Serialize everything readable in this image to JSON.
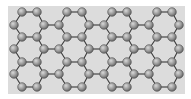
{
  "diagram": {
    "type": "hexagonal-lattice",
    "colors": {
      "page_background": "#ffffff",
      "panel_background": "#dcdcdc",
      "atom_fill_light": "#c8c8c8",
      "atom_fill_dark": "#6e6e6e",
      "atom_stroke": "#4a4a4a",
      "bond": "#3a3a3a"
    },
    "panel": {
      "x": 8,
      "y": 6,
      "width": 177,
      "height": 88
    },
    "atom_radius": 4.3,
    "rows": {
      "A": [
        22,
        37,
        67,
        82,
        112,
        127,
        157,
        172
      ],
      "B": [
        14,
        44,
        59,
        89,
        104,
        134,
        149,
        179
      ]
    },
    "row_y": [
      12,
      25,
      37,
      49,
      62,
      74,
      87
    ],
    "row_types": [
      "A",
      "B",
      "A",
      "B",
      "A",
      "B",
      "A"
    ]
  }
}
